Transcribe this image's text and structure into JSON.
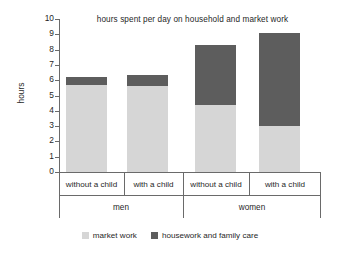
{
  "chart_data": {
    "type": "bar",
    "stacked": true,
    "title": "hours spent per day on household and market work",
    "xlabel": "",
    "ylabel": "hours",
    "ylim": [
      0,
      10
    ],
    "ytick_step": 1,
    "yticks": [
      "10",
      "9",
      "8",
      "7",
      "6",
      "5",
      "4",
      "3",
      "2",
      "1",
      "0"
    ],
    "grid": false,
    "legend_position": "bottom",
    "categories": [
      "without a child",
      "with a child",
      "without a child",
      "with a child"
    ],
    "groups": [
      {
        "label": "men",
        "categories": [
          "without a child",
          "with a child"
        ]
      },
      {
        "label": "women",
        "categories": [
          "without a child",
          "with a child"
        ]
      }
    ],
    "series": [
      {
        "name": "market work",
        "color": "#d6d6d6",
        "values": [
          5.7,
          5.6,
          4.35,
          3.0
        ]
      },
      {
        "name": "housework and family care",
        "color": "#5d5d5d",
        "values": [
          0.5,
          0.75,
          3.95,
          6.1
        ]
      }
    ],
    "totals": [
      6.2,
      6.35,
      8.3,
      9.1
    ]
  },
  "legend": {
    "items": [
      {
        "label": "market work",
        "color": "#d6d6d6"
      },
      {
        "label": "housework and family care",
        "color": "#5d5d5d"
      }
    ]
  }
}
